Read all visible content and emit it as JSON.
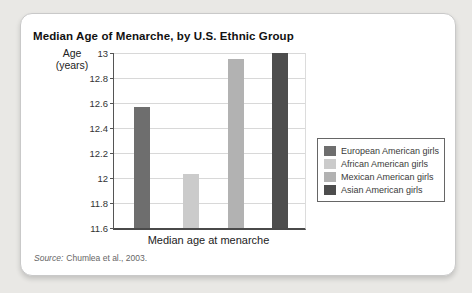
{
  "chart_data": {
    "type": "bar",
    "title": "Median Age of Menarche, by U.S. Ethnic Group",
    "categories": [
      "European American girls",
      "African American girls",
      "Mexican American girls",
      "Asian American girls"
    ],
    "values": [
      12.57,
      12.03,
      12.95,
      13
    ],
    "colors": [
      "#6e6e6e",
      "#cbcbcb",
      "#b2b2b2",
      "#4d4d4d"
    ],
    "xlabel": "Median age at menarche",
    "ylabel": "Age (years)",
    "ylim": [
      11.6,
      13
    ],
    "yticks": [
      13,
      12.8,
      12.6,
      12.4,
      12.2,
      12,
      11.8,
      11.6
    ],
    "grid": true,
    "legend_position": "right"
  },
  "source": {
    "prefix": "Source:",
    "text": "Chumlea et al., 2003."
  }
}
